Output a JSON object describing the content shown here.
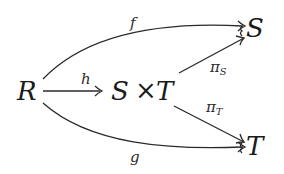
{
  "diagram": {
    "type": "commutative-diagram",
    "objects": {
      "R": "R",
      "product": {
        "left": "S",
        "times": "×",
        "right": "T"
      },
      "S": "S",
      "T": "T"
    },
    "morphisms": {
      "f": {
        "label": "f",
        "from": "R",
        "to": "S"
      },
      "h": {
        "label": "h",
        "from": "R",
        "to": "S × T"
      },
      "g": {
        "label": "g",
        "from": "R",
        "to": "T"
      },
      "pi_S": {
        "label": "π",
        "subscript": "S",
        "from": "S × T",
        "to": "S"
      },
      "pi_T": {
        "label": "π",
        "subscript": "T",
        "from": "S × T",
        "to": "T"
      }
    }
  }
}
